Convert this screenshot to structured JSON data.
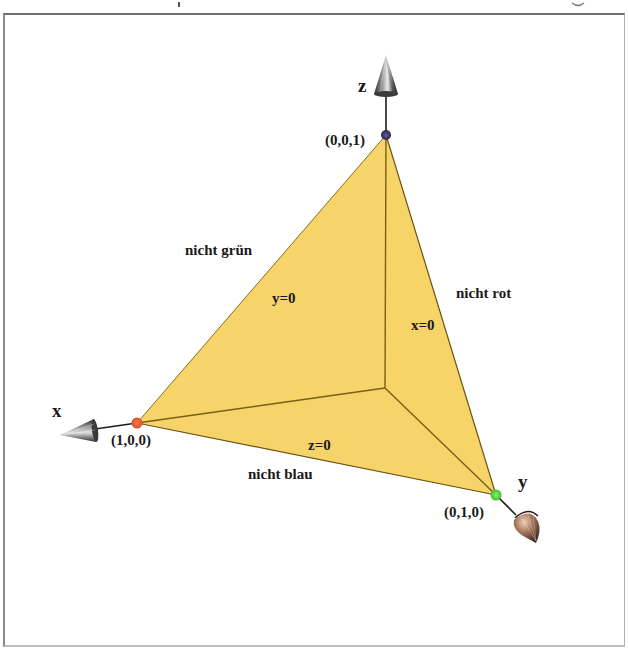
{
  "figure": {
    "axes": {
      "x": {
        "label": "x"
      },
      "y": {
        "label": "y"
      },
      "z": {
        "label": "z"
      }
    },
    "vertices": [
      {
        "id": "x-vertex",
        "label": "(1,0,0)",
        "color": "#e8613a"
      },
      {
        "id": "y-vertex",
        "label": "(0,1,0)",
        "color": "#6fd24a"
      },
      {
        "id": "z-vertex",
        "label": "(0,0,1)",
        "color": "#4a3a7a"
      }
    ],
    "faces": [
      {
        "id": "face-y0",
        "label": "y=0",
        "side_label": "nicht grün"
      },
      {
        "id": "face-x0",
        "label": "x=0",
        "side_label": "nicht rot"
      },
      {
        "id": "face-z0",
        "label": "z=0",
        "side_label": "nicht blau"
      }
    ],
    "colors": {
      "fill": "#f8d56a",
      "fill_shade": "#f4cd5c",
      "edge": "#6b5414",
      "axis": "#1c1c1c"
    }
  }
}
